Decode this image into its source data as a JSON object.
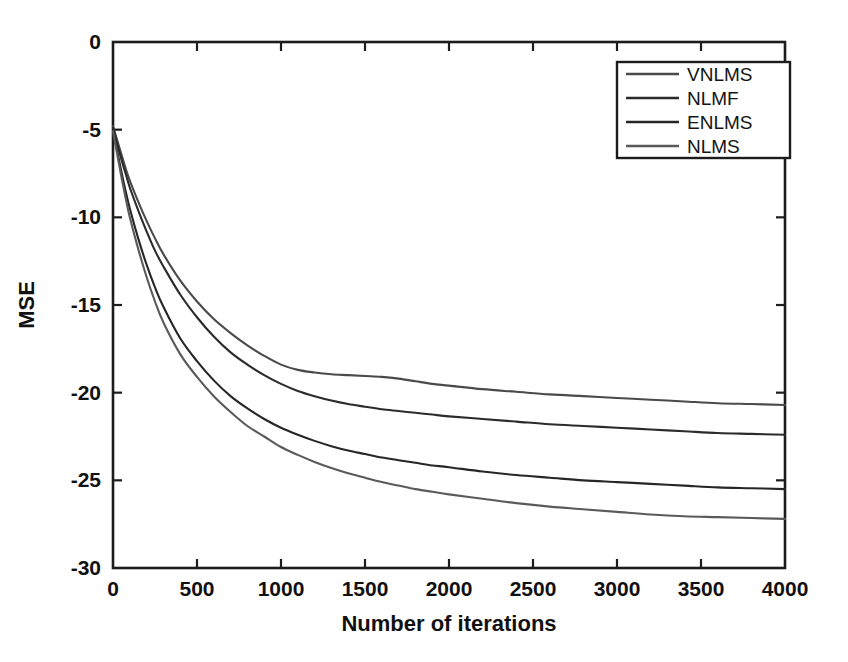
{
  "chart_data": {
    "type": "line",
    "title": "",
    "subtitle": "",
    "xlabel": "Number of iterations",
    "ylabel": "MSE",
    "xlim": [
      0,
      4000
    ],
    "ylim": [
      -30,
      0
    ],
    "xticks": [
      0,
      500,
      1000,
      1500,
      2000,
      2500,
      3000,
      3500,
      4000
    ],
    "xticklabels": [
      "0",
      "500",
      "1000",
      "1500",
      "2000",
      "2500",
      "3000",
      "3500",
      "4000"
    ],
    "yticks": [
      0,
      -5,
      -10,
      -15,
      -20,
      -25,
      -30
    ],
    "yticklabels": [
      "0",
      "-5",
      "-10",
      "-15",
      "-20",
      "-25",
      "-30"
    ],
    "grid": false,
    "legend_position": "upper right",
    "legend_entries": [
      "VNLMS",
      "NLMF",
      "ENLMS",
      "NLMS"
    ],
    "x": [
      0,
      25,
      50,
      75,
      100,
      150,
      200,
      250,
      300,
      400,
      500,
      600,
      700,
      800,
      900,
      1000,
      1100,
      1200,
      1300,
      1400,
      1500,
      1600,
      1700,
      1800,
      1900,
      2000,
      2200,
      2400,
      2600,
      2800,
      3000,
      3200,
      3400,
      3600,
      3800,
      4000
    ],
    "series": [
      {
        "name": "VNLMS",
        "color": "#4a4a4a",
        "values": [
          -4.8,
          -5.6,
          -6.4,
          -7.2,
          -7.9,
          -9.1,
          -10.2,
          -11.2,
          -12.1,
          -13.6,
          -14.8,
          -15.8,
          -16.6,
          -17.3,
          -17.9,
          -18.4,
          -18.7,
          -18.85,
          -18.95,
          -19.0,
          -19.05,
          -19.1,
          -19.2,
          -19.35,
          -19.5,
          -19.6,
          -19.8,
          -19.95,
          -20.1,
          -20.2,
          -20.3,
          -20.4,
          -20.5,
          -20.6,
          -20.65,
          -20.7
        ]
      },
      {
        "name": "NLMF",
        "color": "#2b2b2b",
        "values": [
          -4.9,
          -5.8,
          -6.7,
          -7.5,
          -8.3,
          -9.6,
          -10.8,
          -11.9,
          -12.8,
          -14.4,
          -15.7,
          -16.8,
          -17.7,
          -18.4,
          -19.0,
          -19.5,
          -19.9,
          -20.2,
          -20.45,
          -20.65,
          -20.8,
          -20.95,
          -21.05,
          -21.15,
          -21.25,
          -21.35,
          -21.5,
          -21.65,
          -21.8,
          -21.9,
          -22.0,
          -22.1,
          -22.2,
          -22.3,
          -22.35,
          -22.4
        ]
      },
      {
        "name": "ENLMS",
        "color": "#262626",
        "values": [
          -5.0,
          -6.2,
          -7.4,
          -8.5,
          -9.5,
          -11.2,
          -12.7,
          -14.0,
          -15.1,
          -16.9,
          -18.2,
          -19.3,
          -20.2,
          -20.9,
          -21.5,
          -22.0,
          -22.4,
          -22.75,
          -23.05,
          -23.3,
          -23.5,
          -23.7,
          -23.85,
          -24.0,
          -24.15,
          -24.25,
          -24.5,
          -24.7,
          -24.85,
          -25.0,
          -25.1,
          -25.2,
          -25.3,
          -25.4,
          -25.45,
          -25.5
        ]
      },
      {
        "name": "NLMS",
        "color": "#5a5a5a",
        "values": [
          -5.1,
          -6.4,
          -7.7,
          -8.9,
          -10.0,
          -11.8,
          -13.4,
          -14.8,
          -16.0,
          -17.8,
          -19.1,
          -20.2,
          -21.1,
          -21.9,
          -22.5,
          -23.1,
          -23.55,
          -23.95,
          -24.3,
          -24.6,
          -24.85,
          -25.1,
          -25.3,
          -25.5,
          -25.65,
          -25.8,
          -26.05,
          -26.3,
          -26.5,
          -26.65,
          -26.8,
          -26.95,
          -27.05,
          -27.1,
          -27.15,
          -27.2
        ]
      }
    ]
  }
}
